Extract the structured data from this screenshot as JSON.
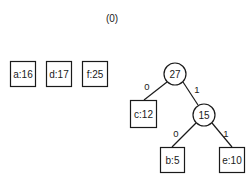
{
  "title": "(0)",
  "forest": [
    {
      "id": "a",
      "label": "a:16",
      "x": 10,
      "y": 61,
      "w": 25,
      "h": 25
    },
    {
      "id": "d",
      "label": "d:17",
      "x": 46,
      "y": 61,
      "w": 25,
      "h": 25
    },
    {
      "id": "f",
      "label": "f:25",
      "x": 82,
      "y": 61,
      "w": 25,
      "h": 25
    }
  ],
  "tree": {
    "internal": [
      {
        "id": "n27",
        "label": "27",
        "cx": 175,
        "cy": 74,
        "r": 11
      },
      {
        "id": "n15",
        "label": "15",
        "cx": 204,
        "cy": 115,
        "r": 11
      }
    ],
    "leaves": [
      {
        "id": "c",
        "label": "c:12",
        "x": 130,
        "y": 100,
        "w": 26,
        "h": 27
      },
      {
        "id": "b",
        "label": "b:5",
        "x": 160,
        "y": 147,
        "w": 24,
        "h": 25
      },
      {
        "id": "e",
        "label": "e:10",
        "x": 219,
        "y": 147,
        "w": 25,
        "h": 25
      }
    ],
    "edges": [
      {
        "from": "n27",
        "to": "c",
        "bit": "0",
        "x1": 167,
        "y1": 82,
        "x2": 144,
        "y2": 100,
        "lx": 147,
        "ly": 90
      },
      {
        "from": "n27",
        "to": "n15",
        "bit": "1",
        "x1": 183,
        "y1": 82,
        "x2": 198,
        "y2": 105,
        "lx": 197,
        "ly": 93
      },
      {
        "from": "n15",
        "to": "b",
        "bit": "0",
        "x1": 196,
        "y1": 123,
        "x2": 172,
        "y2": 147,
        "lx": 176,
        "ly": 137
      },
      {
        "from": "n15",
        "to": "e",
        "bit": "1",
        "x1": 212,
        "y1": 123,
        "x2": 232,
        "y2": 147,
        "lx": 226,
        "ly": 137
      }
    ]
  },
  "colors": {
    "stroke": "#1a1a1a",
    "background": "#ffffff"
  }
}
